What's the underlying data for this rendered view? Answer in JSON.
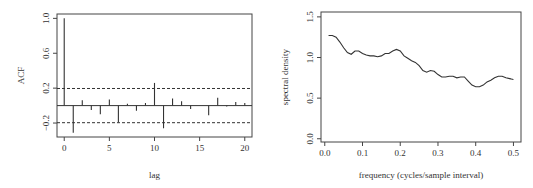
{
  "chart_data": [
    {
      "type": "bar",
      "subtype": "acf-stem",
      "title": "",
      "xlabel": "lag",
      "ylabel": "ACF",
      "x": [
        0,
        1,
        2,
        3,
        4,
        5,
        6,
        7,
        8,
        9,
        10,
        11,
        12,
        13,
        14,
        15,
        16,
        17,
        18,
        19,
        20
      ],
      "values": [
        1.0,
        -0.31,
        0.06,
        -0.05,
        -0.1,
        0.07,
        -0.19,
        0.02,
        -0.06,
        0.03,
        0.26,
        -0.26,
        0.08,
        0.05,
        -0.04,
        0.0,
        -0.11,
        0.09,
        -0.01,
        0.04,
        0.03
      ],
      "confidence_bounds": [
        -0.196,
        0.196
      ],
      "xlim": [
        -0.8,
        20.8
      ],
      "ylim": [
        -0.36,
        1.05
      ],
      "xticks": [
        0,
        5,
        10,
        15,
        20
      ],
      "xtick_labels": [
        "0",
        "5",
        "10",
        "15",
        "20"
      ],
      "yticks": [
        -0.2,
        0.2,
        0.6,
        1.0
      ],
      "ytick_labels": [
        "-0.2",
        "0.2",
        "0.6",
        "1.0"
      ],
      "grid": false,
      "legend": "none"
    },
    {
      "type": "line",
      "title": "",
      "xlabel": "frequency (cycles/sample interval)",
      "ylabel": "spectral density",
      "x": [
        0.01,
        0.02,
        0.03,
        0.04,
        0.05,
        0.06,
        0.07,
        0.08,
        0.09,
        0.1,
        0.11,
        0.12,
        0.13,
        0.14,
        0.15,
        0.16,
        0.17,
        0.18,
        0.19,
        0.2,
        0.21,
        0.22,
        0.23,
        0.24,
        0.25,
        0.26,
        0.27,
        0.28,
        0.29,
        0.3,
        0.31,
        0.32,
        0.33,
        0.34,
        0.35,
        0.36,
        0.37,
        0.38,
        0.39,
        0.4,
        0.41,
        0.42,
        0.43,
        0.44,
        0.45,
        0.46,
        0.47,
        0.48,
        0.49,
        0.5
      ],
      "series": [
        {
          "name": "spectral density",
          "values": [
            1.27,
            1.27,
            1.25,
            1.19,
            1.12,
            1.06,
            1.04,
            1.08,
            1.08,
            1.05,
            1.03,
            1.02,
            1.02,
            1.01,
            1.02,
            1.05,
            1.05,
            1.08,
            1.1,
            1.08,
            1.02,
            0.99,
            0.96,
            0.94,
            0.9,
            0.84,
            0.82,
            0.84,
            0.83,
            0.79,
            0.76,
            0.76,
            0.77,
            0.77,
            0.75,
            0.76,
            0.76,
            0.71,
            0.66,
            0.64,
            0.64,
            0.66,
            0.7,
            0.72,
            0.75,
            0.77,
            0.77,
            0.75,
            0.74,
            0.73
          ]
        }
      ],
      "xlim": [
        -0.01,
        0.52
      ],
      "ylim": [
        -0.04,
        1.56
      ],
      "xticks": [
        0.0,
        0.1,
        0.2,
        0.3,
        0.4,
        0.5
      ],
      "xtick_labels": [
        "0.0",
        "0.1",
        "0.2",
        "0.3",
        "0.4",
        "0.5"
      ],
      "yticks": [
        0.0,
        0.5,
        1.0,
        1.5
      ],
      "ytick_labels": [
        "0.0",
        "0.5",
        "1.0",
        "1.5"
      ],
      "grid": false,
      "legend": "none"
    }
  ]
}
